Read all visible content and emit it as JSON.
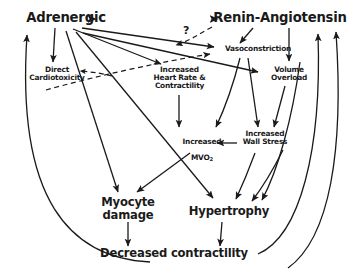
{
  "diagram": {
    "background_color": "#ffffff",
    "line_color": "#1a1a1a",
    "accent_color": "#9c3550",
    "nodes": {
      "adrenergic": {
        "label": "Adrenergic",
        "x": 66,
        "y": 14
      },
      "renin": {
        "label": "Renin-Angiotensin",
        "x": 272,
        "y": 14
      },
      "vasoconstriction": {
        "label": "Vasoconstriction",
        "x": 258,
        "y": 50
      },
      "direct_cardiotoxicity": {
        "label": "Direct\nCardiotoxicity",
        "x": 57,
        "y": 73
      },
      "increased_hr": {
        "label": "Increased\nHeart Rate &\nContractility",
        "x": 179,
        "y": 73
      },
      "volume_overload": {
        "label": "Volume\nOverload",
        "x": 289,
        "y": 73
      },
      "increased_mvo2_pre": {
        "label": "Increased",
        "x": 201,
        "y": 137
      },
      "increased_mvo2_post": {
        "label": "MVO",
        "subscript": "2",
        "x": 201,
        "y": 146
      },
      "increased_wall_stress": {
        "label": "Increased\nWall Stress",
        "x": 264,
        "y": 137
      },
      "myocyte_damage": {
        "label": "Myocyte\ndamage",
        "x": 127,
        "y": 204
      },
      "hypertrophy": {
        "label": "Hypertrophy",
        "x": 230,
        "y": 212
      },
      "decreased_contractility": {
        "label": "Decreased contractility",
        "x": 173,
        "y": 255
      }
    },
    "annotations": {
      "question_mark": {
        "label": "?",
        "x": 186,
        "y": 30
      }
    },
    "edge_styles": {
      "solid": "solid",
      "dashed": "dashed",
      "bidirectional": "bidirectional"
    }
  }
}
